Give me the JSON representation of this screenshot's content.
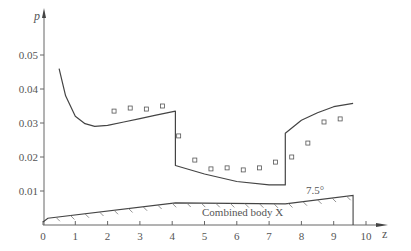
{
  "chart_data": {
    "type": "line",
    "title": "",
    "xlabel": "z",
    "ylabel": "p",
    "xlim": [
      0,
      10.5
    ],
    "ylim": [
      0,
      0.058
    ],
    "grid": false,
    "x_ticks": [
      "0",
      "1",
      "2",
      "3",
      "4",
      "5",
      "6",
      "7",
      "8",
      "9",
      "10"
    ],
    "y_ticks": [
      "0.01",
      "0.02",
      "0.03",
      "0.04",
      "0.05"
    ],
    "series": [
      {
        "name": "theory",
        "style": "line",
        "x": [
          0.5,
          0.7,
          1.0,
          1.3,
          1.6,
          2.0,
          2.5,
          3.0,
          3.5,
          4.1,
          4.1,
          5.0,
          6.0,
          7.0,
          7.5,
          7.5,
          8.0,
          8.5,
          9.0,
          9.6
        ],
        "y": [
          0.046,
          0.038,
          0.032,
          0.0298,
          0.029,
          0.0293,
          0.0303,
          0.0313,
          0.0323,
          0.0335,
          0.0175,
          0.015,
          0.0128,
          0.0118,
          0.0118,
          0.027,
          0.0308,
          0.033,
          0.0348,
          0.0358
        ]
      },
      {
        "name": "experiment",
        "style": "square-markers",
        "x": [
          2.2,
          2.7,
          3.2,
          3.7,
          4.2,
          4.7,
          5.2,
          5.7,
          6.2,
          6.7,
          7.2,
          7.7,
          8.2,
          8.7,
          9.2
        ],
        "y": [
          0.0335,
          0.0344,
          0.0341,
          0.035,
          0.0262,
          0.0191,
          0.0165,
          0.0168,
          0.0162,
          0.0168,
          0.0185,
          0.02,
          0.0241,
          0.0303,
          0.0312
        ]
      }
    ],
    "annotations": [
      {
        "text": "Combined body X",
        "x": 5.0,
        "y": 0.0035
      },
      {
        "text": "7.5°",
        "x": 8.2,
        "y": 0.0095
      }
    ],
    "body_profile": {
      "label": "Combined body X",
      "angle_label": "7.5°",
      "x": [
        0,
        0.15,
        4.1,
        7.5,
        9.6,
        9.6
      ],
      "y": [
        0.0009,
        0.002,
        0.0065,
        0.0062,
        0.0087,
        0
      ]
    }
  }
}
